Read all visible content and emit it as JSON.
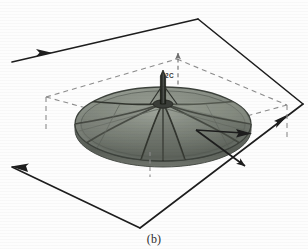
{
  "figure": {
    "caption": "(b)",
    "label_dimension_vertical": "2C",
    "panel_id": "b",
    "colors": {
      "background": "#fdfdfd",
      "ink": "#1d1d1d",
      "dashed_guide": "#8d8d8d",
      "dish_rim": "#4a4f4a",
      "dish_panel_light": "#8e938b",
      "dish_panel_mid": "#767b74",
      "dish_panel_dark": "#5c615b",
      "dish_underside": "#6a6f68",
      "mast": "#2a2c29",
      "rib": "#3b3e3a",
      "caption_text": "#2b2b2b"
    },
    "ground_plane": {
      "name": "reference-parallelogram",
      "style": "solid",
      "vertices": [
        {
          "x": 198,
          "y": 19
        },
        {
          "x": 303,
          "y": 104
        },
        {
          "x": 140,
          "y": 228
        },
        {
          "x": 12,
          "y": 62
        }
      ],
      "arrow_markers": 4
    },
    "bounding_box": {
      "name": "dashed-envelope",
      "style": "dashed",
      "top_face_vertices": [
        {
          "x": 177,
          "y": 59
        },
        {
          "x": 287,
          "y": 105
        },
        {
          "x": 181,
          "y": 134
        },
        {
          "x": 46,
          "y": 97
        }
      ],
      "drop_lines": [
        {
          "x": 46,
          "y1": 97,
          "y2": 131
        },
        {
          "x": 287,
          "y1": 105,
          "y2": 139
        }
      ]
    },
    "dimension_markers": [
      {
        "name": "vertical-height",
        "label": "2C",
        "orientation": "vertical",
        "x": 178,
        "y_top": 52,
        "y_bottom": 90,
        "arrow": "up"
      },
      {
        "name": "lower-center-tick",
        "label": "",
        "orientation": "vertical",
        "x": 150,
        "y_top": 150,
        "y_bottom": 176,
        "arrow": "none"
      },
      {
        "name": "radial-arrow",
        "label": "",
        "orientation": "diagonal",
        "arrow": "down-right"
      }
    ],
    "reflector": {
      "name": "parabolic-dish",
      "center": {
        "x": 163,
        "y": 124
      },
      "rx": 88,
      "ry": 37,
      "rim_thickness": 6,
      "rib_count": 8,
      "has_central_mast": true,
      "mast_height": 34
    }
  }
}
